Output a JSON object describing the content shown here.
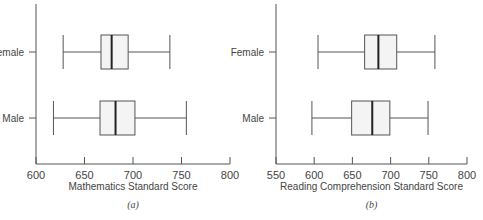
{
  "chart_data": [
    {
      "type": "boxplot",
      "panel": "(a)",
      "title": "",
      "xlabel": "Mathematics Standard Score",
      "ylabel": "",
      "xlim": [
        600,
        800
      ],
      "xticks": [
        600,
        650,
        700,
        750,
        800
      ],
      "categories": [
        "Female",
        "Male"
      ],
      "series": [
        {
          "name": "Female",
          "whisker_low": 628,
          "q1": 667,
          "median": 678,
          "q3": 695,
          "whisker_high": 738
        },
        {
          "name": "Male",
          "whisker_low": 618,
          "q1": 666,
          "median": 682,
          "q3": 702,
          "whisker_high": 755
        }
      ],
      "grid": false,
      "orientation": "horizontal"
    },
    {
      "type": "boxplot",
      "panel": "(b)",
      "title": "",
      "xlabel": "Reading Comprehension Standard Score",
      "ylabel": "",
      "xlim": [
        550,
        800
      ],
      "xticks": [
        550,
        600,
        650,
        700,
        750,
        800
      ],
      "categories": [
        "Female",
        "Male"
      ],
      "series": [
        {
          "name": "Female",
          "whisker_low": 605,
          "q1": 666,
          "median": 684,
          "q3": 708,
          "whisker_high": 758
        },
        {
          "name": "Male",
          "whisker_low": 597,
          "q1": 649,
          "median": 676,
          "q3": 699,
          "whisker_high": 749
        }
      ],
      "grid": false,
      "orientation": "horizontal"
    }
  ],
  "colors": {
    "axis": "#555555",
    "box_fill": "#f4f4f4",
    "box_stroke": "#555555",
    "median": "#222222",
    "text": "#444444"
  }
}
